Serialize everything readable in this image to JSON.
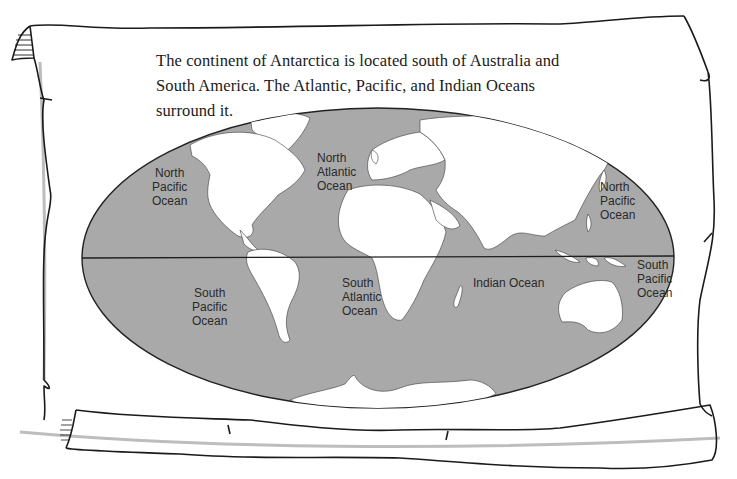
{
  "caption": {
    "lines": [
      "The continent of Antarctica is located south of Australia and",
      "South America. The Atlantic, Pacific, and Indian Oceans",
      "surround it."
    ]
  },
  "map": {
    "projection": "elliptical world map",
    "colors": {
      "ocean": "#a9a9a9",
      "land": "#ffffff",
      "outline": "#222222",
      "equator": "#1e1e1e"
    },
    "labels": [
      {
        "id": "north-pacific-west",
        "lines": [
          "North",
          "Pacific",
          "Ocean"
        ]
      },
      {
        "id": "north-atlantic",
        "lines": [
          "North",
          "Atlantic",
          "Ocean"
        ]
      },
      {
        "id": "north-pacific-east",
        "lines": [
          "North",
          "Pacific",
          "Ocean"
        ]
      },
      {
        "id": "south-pacific-west",
        "lines": [
          "South",
          "Pacific",
          "Ocean"
        ]
      },
      {
        "id": "south-atlantic",
        "lines": [
          "South",
          "Atlantic",
          "Ocean"
        ]
      },
      {
        "id": "indian-ocean",
        "lines": [
          "Indian Ocean"
        ]
      },
      {
        "id": "south-pacific-east",
        "lines": [
          "South",
          "Pacific",
          "Ocean"
        ]
      }
    ]
  }
}
